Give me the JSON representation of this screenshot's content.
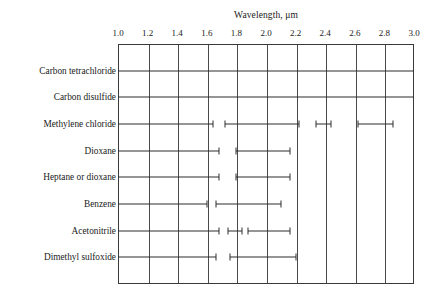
{
  "chart_data": {
    "type": "bar",
    "title": "Wavelength, μm",
    "xlabel": "Wavelength, μm",
    "ylabel": "",
    "xlim": [
      1.0,
      3.0
    ],
    "grid": true,
    "legend": "none",
    "orientation": "horizontal",
    "xticks": [
      1.0,
      1.2,
      1.4,
      1.6,
      1.8,
      2.0,
      2.2,
      2.4,
      2.6,
      2.8,
      3.0
    ],
    "xtick_labels": [
      "1.0",
      "1.2",
      "1.4",
      "1.6",
      "1.8",
      "2.0",
      "2.2",
      "2.4",
      "2.6",
      "2.8",
      "3.0"
    ],
    "categories": [
      "Carbon tetrachloride",
      "Carbon disulfide",
      "Methylene chloride",
      "Dioxane",
      "Heptane or dioxane",
      "Benzene",
      "Acetonitrile",
      "Dimethyl sulfoxide"
    ],
    "series": [
      {
        "name": "Carbon tetrachloride",
        "segments": [
          [
            1.0,
            3.0
          ]
        ]
      },
      {
        "name": "Carbon disulfide",
        "segments": [
          [
            1.0,
            3.0
          ]
        ]
      },
      {
        "name": "Methylene chloride",
        "segments": [
          [
            1.0,
            1.64
          ],
          [
            1.72,
            2.22
          ],
          [
            2.34,
            2.44
          ],
          [
            2.62,
            2.86
          ]
        ]
      },
      {
        "name": "Dioxane",
        "segments": [
          [
            1.0,
            1.68
          ],
          [
            1.8,
            2.16
          ]
        ]
      },
      {
        "name": "Heptane or dioxane",
        "segments": [
          [
            1.0,
            1.68
          ],
          [
            1.8,
            2.16
          ]
        ]
      },
      {
        "name": "Benzene",
        "segments": [
          [
            1.0,
            1.6
          ],
          [
            1.66,
            2.1
          ]
        ]
      },
      {
        "name": "Acetonitrile",
        "segments": [
          [
            1.0,
            1.68
          ],
          [
            1.74,
            1.84
          ],
          [
            1.88,
            2.16
          ]
        ]
      },
      {
        "name": "Dimethyl sulfoxide",
        "segments": [
          [
            1.0,
            1.66
          ],
          [
            1.76,
            2.2
          ]
        ]
      }
    ]
  }
}
